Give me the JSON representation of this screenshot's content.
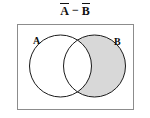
{
  "figure": {
    "title_left_operand": "A",
    "title_operator": "−",
    "title_right_operand": "B",
    "title_plain": "A̅ − B̅",
    "width_px": 150,
    "height_px": 118
  },
  "universe": {
    "label": "",
    "border_color": "#8c8c8c",
    "fill_color": "#ffffff"
  },
  "sets": [
    {
      "id": "A",
      "label": "A",
      "shaded": false,
      "fill_color": "#ffffff",
      "stroke_color": "#1a1a1a"
    },
    {
      "id": "B",
      "label": "B",
      "shaded": true,
      "fill_color": "#d8d8d8",
      "stroke_color": "#1a1a1a"
    }
  ],
  "regions": {
    "a_only": {
      "name": "A only",
      "shaded": false
    },
    "intersection": {
      "name": "A ∩ B",
      "shaded": false
    },
    "b_only": {
      "name": "B only",
      "shaded": true
    },
    "outside": {
      "name": "outside A ∪ B",
      "shaded": false
    }
  },
  "shading": {
    "shaded_region_label": "B − A",
    "color": "#d8d8d8"
  }
}
